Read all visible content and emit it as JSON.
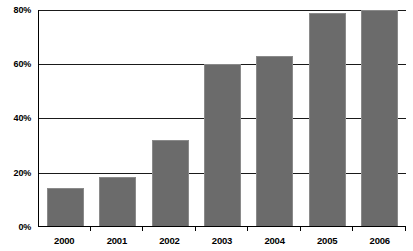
{
  "chart_data": {
    "type": "bar",
    "title": "",
    "xlabel": "",
    "ylabel": "",
    "categories": [
      "2000",
      "2001",
      "2002",
      "2003",
      "2004",
      "2005",
      "2006"
    ],
    "values": [
      14,
      18,
      32,
      60,
      63,
      79,
      80
    ],
    "value_labels": [
      "14%",
      "18%",
      "32%",
      "60%",
      "63%",
      "79%",
      "80%"
    ],
    "ylim": [
      0,
      80
    ],
    "ytick_values": [
      0,
      20,
      40,
      60,
      80
    ],
    "ytick_labels": [
      "0%",
      "20%",
      "40%",
      "60%",
      "80%"
    ],
    "grid": true,
    "grid_axis": "y",
    "legend": false,
    "legend_position": "none",
    "series": [
      {
        "name": "",
        "values": [
          14,
          18,
          32,
          60,
          63,
          79,
          80
        ],
        "color": "#6b6b6b"
      }
    ],
    "colors": {
      "bar_fill": "#6b6b6b",
      "bar_edge": "#8a8a8a",
      "axis": "#000000",
      "gridline": "#1a1a1a",
      "background": "#ffffff",
      "text": "#000000"
    }
  }
}
